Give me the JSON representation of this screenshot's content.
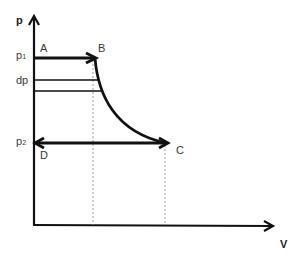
{
  "diagram": {
    "type": "p-V diagram",
    "axes": {
      "y_label": "p",
      "x_label": "V"
    },
    "pressure_labels": {
      "p1": {
        "base": "p",
        "sub": "1"
      },
      "dp": "dp",
      "p2": {
        "base": "p",
        "sub": "2"
      }
    },
    "points": {
      "A": "A",
      "B": "B",
      "C": "C",
      "D": "D"
    },
    "colors": {
      "line": "#111111",
      "dashed": "#888888",
      "text": "#3a3a3a"
    }
  }
}
